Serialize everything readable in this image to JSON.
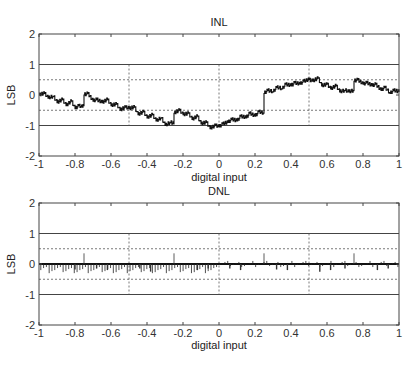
{
  "chart_data": [
    {
      "type": "line",
      "title": "INL",
      "xlabel": "digital input",
      "ylabel": "LSB",
      "xlim": [
        -1,
        1
      ],
      "ylim": [
        -2,
        2
      ],
      "xticks": [
        -1,
        -0.8,
        -0.6,
        -0.4,
        -0.2,
        0,
        0.2,
        0.4,
        0.6,
        0.8,
        1
      ],
      "xtick_labels": [
        "-1",
        "-0.8",
        "-0.6",
        "-0.4",
        "-0.2",
        "0",
        "0.2",
        "0.4",
        "0.6",
        "0.8",
        "1"
      ],
      "yticks": [
        -2,
        -1,
        0,
        1,
        2
      ],
      "ytick_labels": [
        "-2",
        "-1",
        "0",
        "1",
        "2"
      ],
      "solid_hlines": [
        1,
        -1
      ],
      "dashed_hlines": [
        0.5,
        -0.5
      ],
      "dashed_vlines": [
        -0.5,
        0,
        0.5
      ],
      "series": [
        {
          "name": "INL",
          "x": [
            -1,
            -0.97,
            -0.95,
            -0.92,
            -0.9,
            -0.87,
            -0.85,
            -0.82,
            -0.8,
            -0.78,
            -0.76,
            -0.751,
            -0.75,
            -0.73,
            -0.7,
            -0.68,
            -0.65,
            -0.62,
            -0.6,
            -0.57,
            -0.55,
            -0.52,
            -0.5,
            -0.47,
            -0.45,
            -0.42,
            -0.4,
            -0.37,
            -0.35,
            -0.32,
            -0.3,
            -0.27,
            -0.251,
            -0.25,
            -0.22,
            -0.2,
            -0.17,
            -0.15,
            -0.12,
            -0.1,
            -0.07,
            -0.05,
            -0.02,
            0,
            0.02,
            0.05,
            0.07,
            0.1,
            0.12,
            0.15,
            0.17,
            0.2,
            0.22,
            0.249,
            0.25,
            0.27,
            0.3,
            0.32,
            0.35,
            0.37,
            0.4,
            0.42,
            0.45,
            0.47,
            0.5,
            0.52,
            0.55,
            0.57,
            0.6,
            0.62,
            0.65,
            0.67,
            0.7,
            0.72,
            0.749,
            0.75,
            0.77,
            0.8,
            0.82,
            0.85,
            0.87,
            0.9,
            0.92,
            0.95,
            0.97,
            1
          ],
          "y": [
            0.0,
            0.05,
            -0.1,
            -0.05,
            -0.25,
            -0.15,
            -0.35,
            -0.2,
            -0.45,
            -0.35,
            -0.4,
            -0.35,
            0.0,
            0.05,
            -0.2,
            -0.15,
            -0.25,
            -0.15,
            -0.35,
            -0.3,
            -0.5,
            -0.4,
            -0.45,
            -0.4,
            -0.65,
            -0.55,
            -0.75,
            -0.65,
            -0.85,
            -0.75,
            -1.0,
            -0.9,
            -0.95,
            -0.6,
            -0.5,
            -0.65,
            -0.6,
            -0.8,
            -0.7,
            -0.95,
            -0.9,
            -1.1,
            -1.0,
            -1.05,
            -0.95,
            -0.9,
            -0.8,
            -0.85,
            -0.7,
            -0.75,
            -0.6,
            -0.7,
            -0.55,
            -0.6,
            0.05,
            0.15,
            0.1,
            0.25,
            0.2,
            0.35,
            0.3,
            0.4,
            0.35,
            0.45,
            0.5,
            0.45,
            0.55,
            0.3,
            0.35,
            0.2,
            0.3,
            0.1,
            0.15,
            0.1,
            0.15,
            0.45,
            0.5,
            0.35,
            0.4,
            0.3,
            0.35,
            0.15,
            0.25,
            0.05,
            0.15,
            0.1
          ]
        }
      ]
    },
    {
      "type": "stem",
      "title": "DNL",
      "xlabel": "digital input",
      "ylabel": "LSB",
      "xlim": [
        -1,
        1
      ],
      "ylim": [
        -2,
        2
      ],
      "xticks": [
        -1,
        -0.8,
        -0.6,
        -0.4,
        -0.2,
        0,
        0.2,
        0.4,
        0.6,
        0.8,
        1
      ],
      "xtick_labels": [
        "-1",
        "-0.8",
        "-0.6",
        "-0.4",
        "-0.2",
        "0",
        "0.2",
        "0.4",
        "0.6",
        "0.8",
        "1"
      ],
      "yticks": [
        -2,
        -1,
        0,
        1,
        2
      ],
      "ytick_labels": [
        "-2",
        "-1",
        "0",
        "1",
        "2"
      ],
      "solid_hlines": [
        1,
        -1
      ],
      "dashed_hlines": [
        0.5,
        -0.5
      ],
      "dashed_vlines": [
        -0.5,
        0,
        0.5
      ],
      "baseline": 0,
      "noise_amplitude": 0.1,
      "spikes": [
        {
          "x": -0.75,
          "y": 0.35
        },
        {
          "x": -0.25,
          "y": 0.35
        },
        {
          "x": 0.25,
          "y": 0.35
        },
        {
          "x": 0.75,
          "y": 0.35
        },
        {
          "x": -0.62,
          "y": -0.2
        },
        {
          "x": -0.38,
          "y": -0.25
        },
        {
          "x": -0.12,
          "y": -0.2
        },
        {
          "x": 0.12,
          "y": -0.2
        },
        {
          "x": 0.38,
          "y": -0.2
        },
        {
          "x": 0.56,
          "y": -0.25
        },
        {
          "x": 0.62,
          "y": -0.2
        },
        {
          "x": 0.88,
          "y": -0.2
        },
        {
          "x": -0.8,
          "y": -0.18
        },
        {
          "x": -0.68,
          "y": -0.15
        },
        {
          "x": -0.44,
          "y": -0.15
        },
        {
          "x": -0.06,
          "y": -0.15
        },
        {
          "x": 0.06,
          "y": -0.15
        },
        {
          "x": 0.32,
          "y": -0.18
        },
        {
          "x": 0.7,
          "y": -0.15
        },
        {
          "x": 0.94,
          "y": -0.15
        }
      ]
    }
  ],
  "figure": {
    "plots": [
      {
        "title": "INL",
        "xlabel": "digital input",
        "ylabel": "LSB"
      },
      {
        "title": "DNL",
        "xlabel": "digital input",
        "ylabel": "LSB"
      }
    ]
  }
}
